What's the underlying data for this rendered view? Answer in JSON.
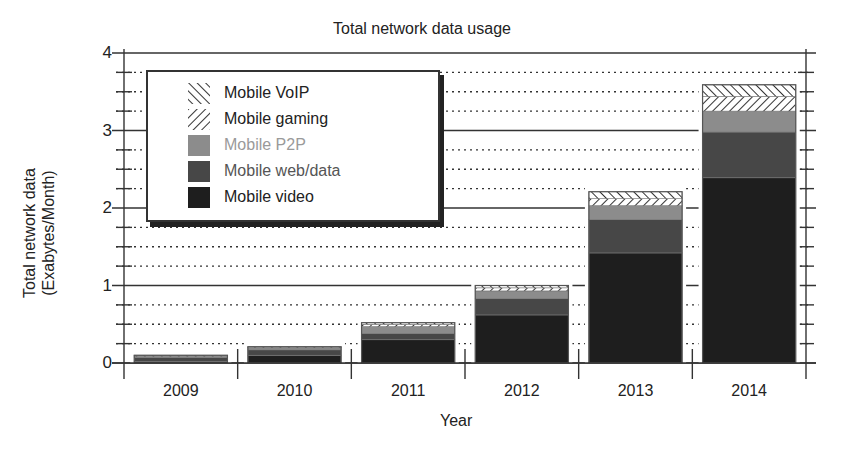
{
  "chart_data": {
    "type": "bar",
    "stacked": true,
    "title": "Total network data usage",
    "xlabel": "Year",
    "ylabel": "Total network data\n(Exabytes/Month)",
    "ylabel_lines": [
      "Total network data",
      "(Exabytes/Month)"
    ],
    "ylim": [
      0,
      4
    ],
    "yticks": [
      0,
      1,
      2,
      3,
      4
    ],
    "minor_gridlines": "dotted at 0.25 intervals",
    "grid": true,
    "legend_position": "upper left",
    "categories": [
      "2009",
      "2010",
      "2011",
      "2012",
      "2013",
      "2014"
    ],
    "series": [
      {
        "name": "Mobile video",
        "color": "#1e1e1e",
        "pattern": "solid",
        "values": [
          0.02,
          0.1,
          0.3,
          0.62,
          1.42,
          2.39
        ]
      },
      {
        "name": "Mobile web/data",
        "color": "#474747",
        "pattern": "solid",
        "values": [
          0.05,
          0.07,
          0.08,
          0.21,
          0.43,
          0.59
        ]
      },
      {
        "name": "Mobile P2P",
        "color": "#8c8c8c",
        "pattern": "solid",
        "values": [
          0.02,
          0.03,
          0.09,
          0.1,
          0.18,
          0.27
        ]
      },
      {
        "name": "Mobile gaming",
        "color": "#ffffff",
        "pattern": "diagonal-forward",
        "values": [
          0.005,
          0.005,
          0.03,
          0.04,
          0.09,
          0.19
        ]
      },
      {
        "name": "Mobile VoIP",
        "color": "#ffffff",
        "pattern": "diagonal-back",
        "values": [
          0.005,
          0.005,
          0.02,
          0.03,
          0.09,
          0.15
        ]
      }
    ],
    "totals": [
      0.1,
      0.21,
      0.52,
      1.0,
      2.21,
      3.59
    ]
  },
  "legend": {
    "items": [
      {
        "label": "Mobile VoIP",
        "color": "#222222"
      },
      {
        "label": "Mobile gaming",
        "color": "#222222"
      },
      {
        "label": "Mobile P2P",
        "color": "#9a9a9a"
      },
      {
        "label": "Mobile web/data",
        "color": "#555555"
      },
      {
        "label": "Mobile video",
        "color": "#222222"
      }
    ]
  }
}
